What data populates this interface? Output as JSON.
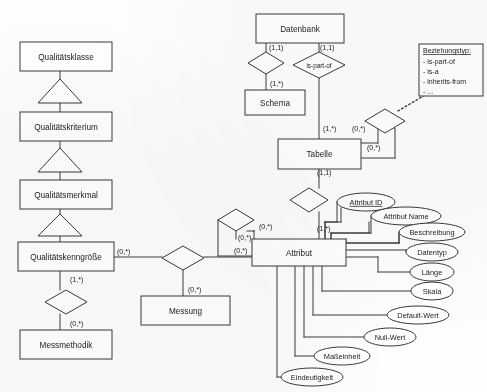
{
  "diagram": {
    "stroke_color": "#3a3a3a",
    "fill_color": "#ffffff",
    "text_color": "#1c1c1c",
    "entities": [
      {
        "id": "qualitaetsklasse",
        "label": "Qualitätsklasse",
        "x": 20,
        "y": 42,
        "w": 92,
        "h": 29
      },
      {
        "id": "qualitaetskriterium",
        "label": "Qualitätskriterium",
        "x": 20,
        "y": 112,
        "w": 92,
        "h": 29
      },
      {
        "id": "qualitaetsmerkmal",
        "label": "Qualitätsmerkmal",
        "x": 20,
        "y": 180,
        "w": 92,
        "h": 29
      },
      {
        "id": "qualitaetskenngroesse",
        "label": "Qualitätskenngröße",
        "x": 18,
        "y": 242,
        "w": 96,
        "h": 29
      },
      {
        "id": "messmethodik",
        "label": "Messmethodik",
        "x": 20,
        "y": 330,
        "w": 92,
        "h": 29
      },
      {
        "id": "messung",
        "label": "Messung",
        "x": 141,
        "y": 296,
        "w": 89,
        "h": 29
      },
      {
        "id": "datenbank",
        "label": "Datenbank",
        "x": 256,
        "y": 14,
        "w": 88,
        "h": 29
      },
      {
        "id": "schema",
        "label": "Schema",
        "x": 245,
        "y": 90,
        "w": 60,
        "h": 25
      },
      {
        "id": "tabelle",
        "label": "Tabelle",
        "x": 278,
        "y": 139,
        "w": 83,
        "h": 30
      },
      {
        "id": "attribut",
        "label": "Attribut",
        "x": 252,
        "y": 239,
        "w": 94,
        "h": 27
      }
    ],
    "relationships": [
      {
        "id": "rel-datenbank-schema",
        "label": "",
        "cx": 266,
        "cy": 63,
        "rx": 18,
        "ry": 11
      },
      {
        "id": "rel-is-part-of",
        "label": "is-part-of",
        "cx": 319,
        "cy": 65,
        "rx": 26,
        "ry": 13
      },
      {
        "id": "rel-tabelle-self",
        "label": "",
        "cx": 385,
        "cy": 121,
        "rx": 20,
        "ry": 12
      },
      {
        "id": "rel-tabelle-attribut",
        "label": "",
        "cx": 309,
        "cy": 200,
        "rx": 19,
        "ry": 12
      },
      {
        "id": "rel-attribut-self",
        "label": "",
        "cx": 236,
        "cy": 220,
        "rx": 18,
        "ry": 11
      },
      {
        "id": "rel-kenngroesse-messung",
        "label": "",
        "cx": 183,
        "cy": 258,
        "rx": 21,
        "ry": 12
      },
      {
        "id": "rel-kenngroesse-methodik",
        "label": "",
        "cx": 66,
        "cy": 302,
        "rx": 21,
        "ry": 12
      }
    ],
    "generalizations": [
      {
        "id": "gen-klasse-kriterium",
        "cx": 60,
        "y_top": 79,
        "y_bot": 103,
        "half": 22
      },
      {
        "id": "gen-kriterium-merkmal",
        "cx": 60,
        "y_top": 148,
        "y_bot": 172,
        "half": 22
      },
      {
        "id": "gen-merkmal-kenngroesse",
        "cx": 60,
        "y_top": 214,
        "y_bot": 236,
        "half": 22
      }
    ],
    "cardinalities": [
      {
        "id": "card-db-schema",
        "text": "(1,1)",
        "x": 269,
        "y": 50
      },
      {
        "id": "card-db-is-part-of",
        "text": "(1,1)",
        "x": 320,
        "y": 50
      },
      {
        "id": "card-schema",
        "text": "(1,*)",
        "x": 270,
        "y": 86
      },
      {
        "id": "card-tabelle-top",
        "text": "(1,*)",
        "x": 323,
        "y": 131
      },
      {
        "id": "card-tabelle-self-a",
        "text": "(0,*)",
        "x": 352,
        "y": 131
      },
      {
        "id": "card-tabelle-self-b",
        "text": "(0,*)",
        "x": 367,
        "y": 150
      },
      {
        "id": "card-tabelle-attribut",
        "text": "(1,1)",
        "x": 317,
        "y": 175
      },
      {
        "id": "card-attribut-top",
        "text": "(1,*)",
        "x": 317,
        "y": 231
      },
      {
        "id": "card-attribut-self-a",
        "text": "(0,*)",
        "x": 259,
        "y": 229
      },
      {
        "id": "card-attribut-self-b",
        "text": "(0,*)",
        "x": 238,
        "y": 240
      },
      {
        "id": "card-attribut-left",
        "text": "(0,*)",
        "x": 234,
        "y": 253
      },
      {
        "id": "card-kenngroesse-right",
        "text": "(0,*)",
        "x": 117,
        "y": 254
      },
      {
        "id": "card-kenngroesse-bot",
        "text": "(1,*)",
        "x": 70,
        "y": 282
      },
      {
        "id": "card-messung",
        "text": "(0,*)",
        "x": 188,
        "y": 292
      },
      {
        "id": "card-messmethodik",
        "text": "(0,*)",
        "x": 70,
        "y": 326
      }
    ],
    "attributes": [
      {
        "id": "attr-attribut-id",
        "label": "Attribut ID",
        "cx": 366,
        "cy": 202,
        "rx": 29,
        "ry": 9,
        "key": true,
        "anchor_x": 325,
        "stub_x": 341,
        "stub_y": 222
      },
      {
        "id": "attr-attribut-name",
        "label": "Attribut Name",
        "cx": 406,
        "cy": 216,
        "rx": 35,
        "ry": 9,
        "key": false,
        "anchor_x": 331,
        "stub_x": 352,
        "stub_y": 233
      },
      {
        "id": "attr-beschreibung",
        "label": "Beschreibung",
        "cx": 432,
        "cy": 232,
        "rx": 33,
        "ry": 9,
        "key": false,
        "anchor_x": 346,
        "stub_x": 374,
        "stub_y": 243
      },
      {
        "id": "attr-datentyp",
        "label": "Datentyp",
        "cx": 432,
        "cy": 252,
        "rx": 26,
        "ry": 9,
        "key": false,
        "anchor_x": 346,
        "stub_x": 383,
        "stub_y": 252
      },
      {
        "id": "attr-laenge",
        "label": "Länge",
        "cx": 432,
        "cy": 272,
        "rx": 22,
        "ry": 9,
        "key": false,
        "anchor_x": 346,
        "stub_x": 378,
        "stub_y": 262
      },
      {
        "id": "attr-skala",
        "label": "Skala",
        "cx": 432,
        "cy": 291,
        "rx": 21,
        "ry": 9,
        "key": false,
        "anchor_x": 322,
        "stub_x": 322,
        "stub_y": 291
      },
      {
        "id": "attr-default-wert",
        "label": "Default-Wert",
        "cx": 418,
        "cy": 315,
        "rx": 31,
        "ry": 9,
        "key": false,
        "anchor_x": 313,
        "stub_x": 313,
        "stub_y": 315
      },
      {
        "id": "attr-null-wert",
        "label": "Null-Wert",
        "cx": 390,
        "cy": 337,
        "rx": 26,
        "ry": 9,
        "key": false,
        "anchor_x": 304,
        "stub_x": 304,
        "stub_y": 337
      },
      {
        "id": "attr-masseinheit",
        "label": "Maßeinheit",
        "cx": 342,
        "cy": 356,
        "rx": 28,
        "ry": 9,
        "key": false,
        "anchor_x": 295,
        "stub_x": 295,
        "stub_y": 356
      },
      {
        "id": "attr-eindeutigkeit",
        "label": "Eindeutigkeit",
        "cx": 312,
        "cy": 377,
        "rx": 31,
        "ry": 9,
        "key": false,
        "anchor_x": 277,
        "stub_x": 277,
        "stub_y": 377
      }
    ],
    "legend": {
      "id": "legend-beziehungstyp",
      "title": "Beziehungstyp:",
      "x": 419,
      "y": 44,
      "w": 64,
      "h": 52,
      "items": [
        "- is-part-of",
        "- is-a",
        "- inherits-from",
        "- ..."
      ]
    }
  }
}
